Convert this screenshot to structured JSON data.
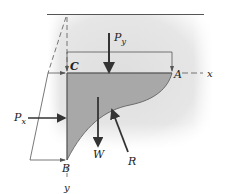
{
  "diagram": {
    "points": {
      "C": "C",
      "A": "A",
      "B": "B"
    },
    "axes": {
      "x": "x",
      "y": "y"
    },
    "forces": {
      "Py_main": "P",
      "Py_sub": "y",
      "Px_main": "P",
      "Px_sub": "x",
      "W": "W",
      "R": "R"
    },
    "colors": {
      "background_shade": "#e4e4e4",
      "fluid_region": "#a8a8a8",
      "line": "#4a4a4a",
      "arrow": "#333333"
    }
  }
}
